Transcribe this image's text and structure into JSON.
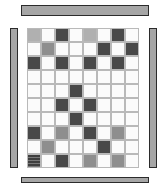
{
  "figure": {
    "width": 166,
    "height": 187,
    "background": "#ffffff"
  },
  "palette": {
    "white": "#fbfbfb",
    "light_gray": "#b0b0b0",
    "medium_gray": "#8e8e8e",
    "dark_gray": "#494949",
    "darker_gray": "#3b3b3b",
    "textured_dark": "#3f3f3f",
    "bar_fill": "#a6a6a6",
    "bar_stroke": "#2b2b2b",
    "cell_stroke": "#b9b9b9"
  },
  "bars": [
    {
      "name": "top-bar",
      "label": "top border bar",
      "fill": "#a6a6a6",
      "x": 21,
      "y": 5,
      "w": 128,
      "h": 11
    },
    {
      "name": "bottom-bar",
      "label": "bottom border bar",
      "fill": "#a6a6a6",
      "x": 21,
      "y": 177,
      "w": 128,
      "h": 6
    },
    {
      "name": "left-bar",
      "label": "left border bar",
      "fill": "#a6a6a6",
      "x": 10,
      "y": 28,
      "w": 8,
      "h": 140
    },
    {
      "name": "right-bar",
      "label": "right border bar",
      "fill": "#a6a6a6",
      "x": 149,
      "y": 28,
      "w": 8,
      "h": 140
    }
  ],
  "grid": {
    "columns": 8,
    "rows": 10,
    "cell_size": 14,
    "origin_x": 27,
    "origin_y": 28,
    "legend": {
      "c-w": "white",
      "c-l": "light-gray",
      "c-m": "medium-gray",
      "c-d": "dark-gray",
      "c-dk": "darker-gray",
      "c-t": "textured-dark"
    },
    "cells": [
      [
        "c-l",
        "c-w",
        "c-d",
        "c-w",
        "c-l",
        "c-w",
        "c-d",
        "c-w"
      ],
      [
        "c-w",
        "c-m",
        "c-w",
        "c-w",
        "c-w",
        "c-d",
        "c-w",
        "c-d"
      ],
      [
        "c-d",
        "c-w",
        "c-d",
        "c-w",
        "c-d",
        "c-w",
        "c-d",
        "c-w"
      ],
      [
        "c-w",
        "c-w",
        "c-w",
        "c-w",
        "c-w",
        "c-w",
        "c-w",
        "c-w"
      ],
      [
        "c-w",
        "c-w",
        "c-w",
        "c-d",
        "c-w",
        "c-w",
        "c-w",
        "c-w"
      ],
      [
        "c-w",
        "c-w",
        "c-d",
        "c-w",
        "c-d",
        "c-w",
        "c-w",
        "c-w"
      ],
      [
        "c-w",
        "c-w",
        "c-w",
        "c-d",
        "c-w",
        "c-w",
        "c-w",
        "c-w"
      ],
      [
        "c-d",
        "c-w",
        "c-m",
        "c-w",
        "c-d",
        "c-w",
        "c-m",
        "c-w"
      ],
      [
        "c-w",
        "c-m",
        "c-w",
        "c-w",
        "c-w",
        "c-d",
        "c-w",
        "c-w"
      ],
      [
        "c-t",
        "c-w",
        "c-d",
        "c-w",
        "c-m",
        "c-w",
        "c-m",
        "c-w"
      ]
    ]
  }
}
